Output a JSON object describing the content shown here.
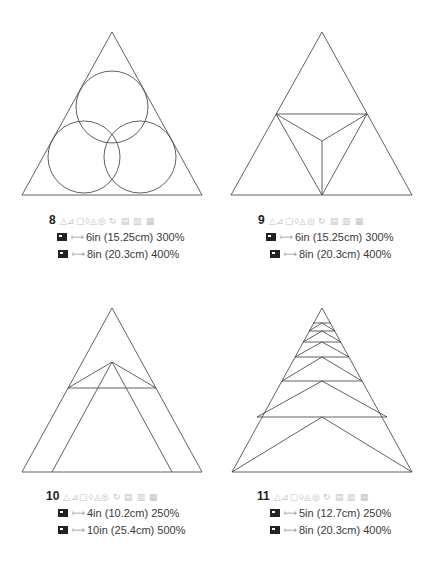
{
  "panels": [
    {
      "number": "8",
      "symbols": "△⊿▢◊◬◎ ↻ ▤ ▥ ▦",
      "sizes": [
        {
          "icon": "pattern-icon",
          "arrow": "⟼",
          "text": "6in (15.25cm) 300%"
        },
        {
          "icon": "pattern-icon",
          "arrow": "⟼",
          "text": "8in (20.3cm) 400%"
        }
      ],
      "figure": "triangle with three overlapping inscribed circles"
    },
    {
      "number": "9",
      "symbols": "△⊿▢◊◬◎ ↻ ▤ ▥ ▦",
      "sizes": [
        {
          "icon": "pattern-icon",
          "arrow": "⟼",
          "text": "6in (15.25cm) 300%"
        },
        {
          "icon": "pattern-icon",
          "arrow": "⟼",
          "text": "8in (20.3cm) 400%"
        }
      ],
      "figure": "triangle subdivided at midpoints with center Y"
    },
    {
      "number": "10",
      "symbols": "△⊿▢◊◬◎ ↻ ▤ ▥ ▦",
      "sizes": [
        {
          "icon": "pattern-icon",
          "arrow": "⟼",
          "text": "4in (10.2cm) 250%"
        },
        {
          "icon": "pattern-icon",
          "arrow": "⟼",
          "text": "10in (25.4cm) 500%"
        }
      ],
      "figure": "triangle with nested inner triangle and crossbar"
    },
    {
      "number": "11",
      "symbols": "△⊿▢◊◬◎ ↻ ▤ ▥ ▦",
      "sizes": [
        {
          "icon": "pattern-icon",
          "arrow": "⟼",
          "text": "5in (12.7cm) 250%"
        },
        {
          "icon": "pattern-icon",
          "arrow": "⟼",
          "text": "8in (20.3cm) 400%"
        }
      ],
      "figure": "triangle with stacked chevron bands"
    }
  ],
  "colors": {
    "line": "#3a3a3a",
    "symbols": "#c4c4c4",
    "text": "#3a3a3a"
  }
}
